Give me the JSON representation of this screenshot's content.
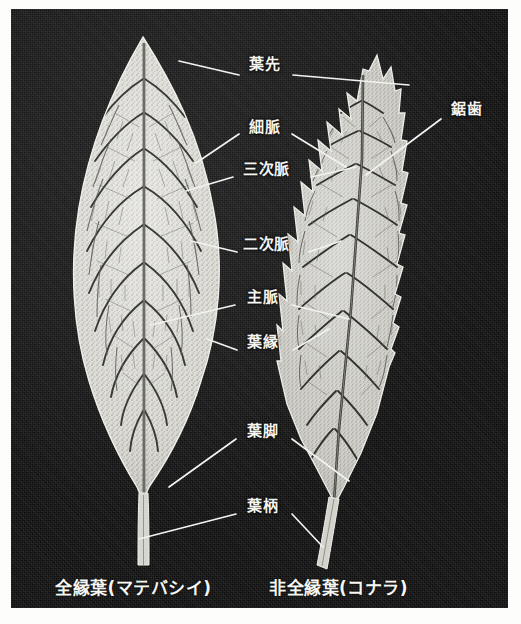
{
  "figure": {
    "background_color": "#fdfdfb",
    "panel_color": "#121212",
    "ink_color": "#f4f4f0"
  },
  "labels": [
    {
      "id": "apex",
      "text": "葉先"
    },
    {
      "id": "serration",
      "text": "鋸歯"
    },
    {
      "id": "veinlet",
      "text": "細脈"
    },
    {
      "id": "tertiary",
      "text": "三次脈"
    },
    {
      "id": "secondary",
      "text": "二次脈"
    },
    {
      "id": "midrib",
      "text": "主脈"
    },
    {
      "id": "margin",
      "text": "葉縁"
    },
    {
      "id": "leafbase",
      "text": "葉脚"
    },
    {
      "id": "petiole",
      "text": "葉柄"
    }
  ],
  "captions": {
    "left": "全縁葉(マテバシイ)",
    "right": "非全縁葉(コナラ)"
  },
  "specimens": [
    {
      "id": "left-leaf",
      "common_name": "マテバシイ",
      "margin_type": "全縁葉"
    },
    {
      "id": "right-leaf",
      "common_name": "コナラ",
      "margin_type": "非全縁葉"
    }
  ]
}
